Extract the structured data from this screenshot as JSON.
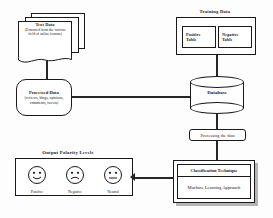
{
  "diagram": {
    "text_data": {
      "title": "Text Data",
      "subtitle": "(Extracted from the various field of online forums)"
    },
    "processed_data": {
      "title": "Processed Data",
      "subtitle": "(reviews, blogs, opinions, comments, tweets)"
    },
    "training_data": {
      "label": "Training  Data",
      "positive_table": "Positive\nTable",
      "positive_table_line1": "Positive",
      "positive_table_line2": "Table",
      "negative_table_line1": "Negative",
      "negative_table_line2": "Table"
    },
    "database": {
      "label": "Database"
    },
    "processing": {
      "label": "Processing  the  data"
    },
    "classification": {
      "title": "Classification  Technique",
      "body": "Machine Learning Approach"
    },
    "output": {
      "label": "Output  Polarity  Levels",
      "faces": [
        {
          "name": "positive",
          "caption": "Positive",
          "mouth": "smile"
        },
        {
          "name": "negative",
          "caption": "Negative",
          "mouth": "frown"
        },
        {
          "name": "neutral",
          "caption": "Neutral",
          "mouth": "flat"
        }
      ]
    },
    "colors": {
      "stroke": "#1a1a1a",
      "connector": "#262626",
      "shadow": "#b5b5b5",
      "background": "#fdfdfd"
    }
  }
}
